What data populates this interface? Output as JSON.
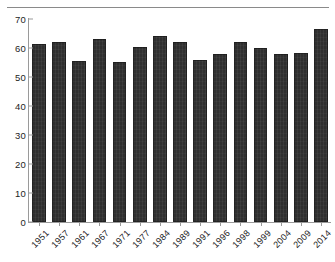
{
  "chart_data": {
    "type": "bar",
    "title": "",
    "subtitle": "",
    "xlabel": "",
    "ylabel": "",
    "categories": [
      "1951",
      "1957",
      "1961",
      "1967",
      "1971",
      "1977",
      "1984",
      "1989",
      "1991",
      "1996",
      "1998",
      "1999",
      "2004",
      "2009",
      "2014"
    ],
    "values": [
      61.5,
      62.0,
      55.5,
      63.0,
      55.3,
      60.5,
      64.0,
      62.0,
      56.0,
      58.0,
      62.0,
      60.0,
      58.0,
      58.2,
      66.5
    ],
    "ylim": [
      0,
      70
    ],
    "yticks": [
      0,
      10,
      20,
      30,
      40,
      50,
      60,
      70
    ],
    "ytick_labels": [
      "0",
      "10",
      "20",
      "30",
      "40",
      "50",
      "60",
      "70"
    ],
    "grid": false,
    "legend": null,
    "legend_position": "none",
    "series": [
      {
        "name": "",
        "values": [
          61.5,
          62.0,
          55.5,
          63.0,
          55.3,
          60.5,
          64.0,
          62.0,
          56.0,
          58.0,
          62.0,
          60.0,
          58.0,
          58.2,
          66.5
        ]
      }
    ],
    "bar_color": "#2f2f2f",
    "axis_color": "#9a9a9a",
    "background_color": "#ffffff",
    "xtick_label_rotation": 45
  }
}
